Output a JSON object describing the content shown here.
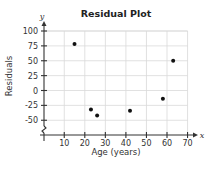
{
  "chart_data": {
    "type": "scatter",
    "title": "Residual Plot",
    "xlabel": "Age (years)",
    "ylabel": "Residuals",
    "x_axis_var": "x",
    "y_axis_var": "y",
    "xlim": [
      0,
      70
    ],
    "ylim": [
      -70,
      100
    ],
    "x_ticks": [
      10,
      20,
      30,
      40,
      50,
      60,
      70
    ],
    "y_ticks": [
      100,
      75,
      50,
      25,
      0,
      -25,
      -50
    ],
    "y_axis_break": true,
    "grid": true,
    "legend": null,
    "series": [
      {
        "name": "Residuals",
        "points": [
          {
            "x": 15,
            "y": 78
          },
          {
            "x": 23,
            "y": -32
          },
          {
            "x": 26,
            "y": -42
          },
          {
            "x": 42,
            "y": -34
          },
          {
            "x": 58,
            "y": -14
          },
          {
            "x": 63,
            "y": 50
          }
        ]
      }
    ]
  }
}
